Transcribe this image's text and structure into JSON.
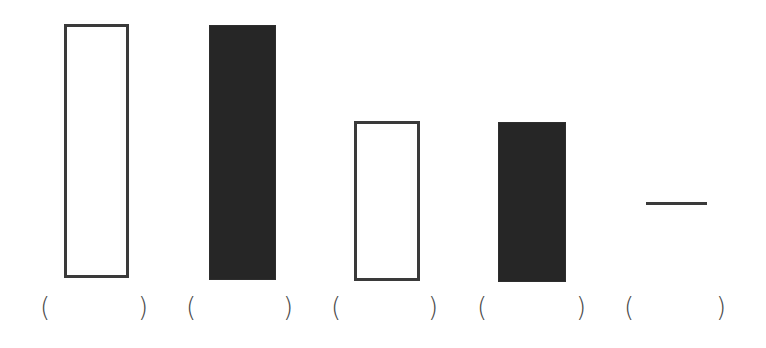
{
  "diagram": {
    "colors": {
      "outline": "#3a3a3a",
      "fill": "#262626",
      "background": "#ffffff"
    },
    "figures": [
      {
        "id": 1,
        "type": "rectangle",
        "style": "outline",
        "size": "tall"
      },
      {
        "id": 2,
        "type": "rectangle",
        "style": "filled",
        "size": "tall"
      },
      {
        "id": 3,
        "type": "rectangle",
        "style": "outline",
        "size": "short"
      },
      {
        "id": 4,
        "type": "rectangle",
        "style": "filled",
        "size": "short"
      },
      {
        "id": 5,
        "type": "line",
        "style": "horizontal segment"
      }
    ],
    "answers": [
      {
        "open": "(",
        "value": "",
        "close": ")"
      },
      {
        "open": "(",
        "value": "",
        "close": ")"
      },
      {
        "open": "(",
        "value": "",
        "close": ")"
      },
      {
        "open": "(",
        "value": "",
        "close": ")"
      },
      {
        "open": "(",
        "value": "",
        "close": ")"
      }
    ]
  }
}
